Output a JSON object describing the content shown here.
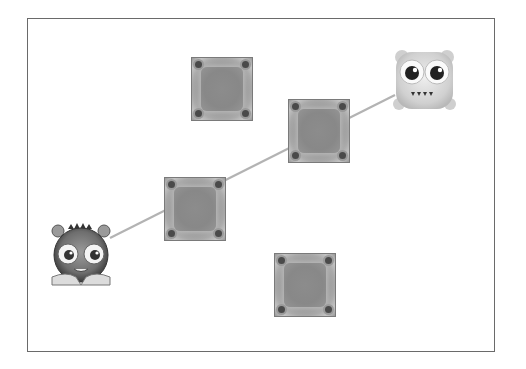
{
  "scene": {
    "board": {
      "x": 27,
      "y": 18,
      "width": 468,
      "height": 334
    },
    "path_line": {
      "from": [
        110,
        238
      ],
      "via": [
        [
          196,
          210
        ],
        [
          319,
          131
        ]
      ],
      "to": [
        395,
        95
      ],
      "color": "#b0b0b0"
    },
    "blocks": [
      {
        "id": "block-1",
        "x": 191,
        "y": 57
      },
      {
        "id": "block-2",
        "x": 288,
        "y": 99
      },
      {
        "id": "block-3",
        "x": 164,
        "y": 177
      },
      {
        "id": "block-4",
        "x": 274,
        "y": 253
      }
    ],
    "characters": [
      {
        "id": "player-monster",
        "x": 50,
        "y": 221,
        "width": 62,
        "height": 66,
        "shade": "dark"
      },
      {
        "id": "target-monster",
        "x": 393,
        "y": 48,
        "width": 63,
        "height": 65,
        "shade": "light"
      }
    ]
  }
}
